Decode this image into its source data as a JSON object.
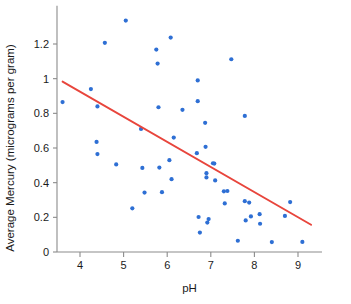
{
  "chart_data": {
    "type": "scatter",
    "title": "",
    "xlabel": "pH",
    "ylabel": "Average Mercury (micrograms per gram)",
    "xlim": [
      3.35,
      9.55
    ],
    "ylim": [
      -0.03,
      1.42
    ],
    "xticks": [
      4,
      5,
      6,
      7,
      8,
      9
    ],
    "xtick_labels": [
      "4",
      "5",
      "6",
      "7",
      "8",
      "9"
    ],
    "yticks": [
      0,
      0.2,
      0.4,
      0.6,
      0.8,
      1.0,
      1.2
    ],
    "ytick_labels": [
      "0",
      "0.2",
      "0.4",
      "0.6",
      "0.8",
      "1",
      "1.2"
    ],
    "grid": false,
    "legend": null,
    "point_color": "#2e6fd4",
    "trend_color": "#e8453c",
    "axis_color": "#8b8b8b",
    "points": [
      {
        "x": 3.6,
        "y": 0.865
      },
      {
        "x": 4.25,
        "y": 0.94
      },
      {
        "x": 4.4,
        "y": 0.84
      },
      {
        "x": 4.38,
        "y": 0.635
      },
      {
        "x": 4.4,
        "y": 0.565
      },
      {
        "x": 4.57,
        "y": 1.207
      },
      {
        "x": 4.83,
        "y": 0.505
      },
      {
        "x": 5.05,
        "y": 1.335
      },
      {
        "x": 5.2,
        "y": 0.252
      },
      {
        "x": 5.4,
        "y": 0.71
      },
      {
        "x": 5.43,
        "y": 0.485
      },
      {
        "x": 5.48,
        "y": 0.343
      },
      {
        "x": 5.75,
        "y": 1.168
      },
      {
        "x": 5.78,
        "y": 1.087
      },
      {
        "x": 5.8,
        "y": 0.835
      },
      {
        "x": 5.82,
        "y": 0.487
      },
      {
        "x": 5.88,
        "y": 0.345
      },
      {
        "x": 6.08,
        "y": 1.237
      },
      {
        "x": 6.05,
        "y": 0.53
      },
      {
        "x": 6.1,
        "y": 0.42
      },
      {
        "x": 6.15,
        "y": 0.66
      },
      {
        "x": 6.35,
        "y": 0.82
      },
      {
        "x": 6.7,
        "y": 0.99
      },
      {
        "x": 6.7,
        "y": 0.87
      },
      {
        "x": 6.68,
        "y": 0.57
      },
      {
        "x": 6.72,
        "y": 0.202
      },
      {
        "x": 6.75,
        "y": 0.112
      },
      {
        "x": 6.87,
        "y": 0.745
      },
      {
        "x": 6.88,
        "y": 0.607
      },
      {
        "x": 6.9,
        "y": 0.455
      },
      {
        "x": 6.9,
        "y": 0.43
      },
      {
        "x": 6.92,
        "y": 0.17
      },
      {
        "x": 6.95,
        "y": 0.19
      },
      {
        "x": 7.05,
        "y": 0.512
      },
      {
        "x": 7.08,
        "y": 0.51
      },
      {
        "x": 7.1,
        "y": 0.413
      },
      {
        "x": 7.3,
        "y": 0.35
      },
      {
        "x": 7.38,
        "y": 0.352
      },
      {
        "x": 7.32,
        "y": 0.28
      },
      {
        "x": 7.47,
        "y": 1.112
      },
      {
        "x": 7.62,
        "y": 0.065
      },
      {
        "x": 7.78,
        "y": 0.785
      },
      {
        "x": 7.78,
        "y": 0.293
      },
      {
        "x": 7.88,
        "y": 0.285
      },
      {
        "x": 7.8,
        "y": 0.182
      },
      {
        "x": 7.92,
        "y": 0.205
      },
      {
        "x": 8.12,
        "y": 0.218
      },
      {
        "x": 8.13,
        "y": 0.163
      },
      {
        "x": 8.4,
        "y": 0.057
      },
      {
        "x": 8.7,
        "y": 0.208
      },
      {
        "x": 8.82,
        "y": 0.288
      },
      {
        "x": 9.1,
        "y": 0.058
      }
    ],
    "trend_line": {
      "x_start": 3.6,
      "y_start": 0.983,
      "x_end": 9.3,
      "y_end": 0.157
    }
  }
}
